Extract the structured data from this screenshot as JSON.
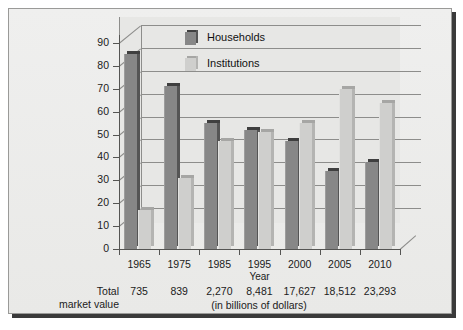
{
  "chart_data": {
    "type": "bar",
    "title": "",
    "xlabel": "Year",
    "ylabel": "",
    "ylim": [
      0,
      90
    ],
    "yticks": [
      0,
      10,
      20,
      30,
      40,
      50,
      60,
      70,
      80,
      90
    ],
    "grid": true,
    "legend_position": "top-center",
    "categories": [
      "1965",
      "1975",
      "1985",
      "1995",
      "2000",
      "2005",
      "2010"
    ],
    "series": [
      {
        "name": "Households",
        "color": "#878787",
        "values": [
          85,
          71,
          55,
          52,
          47,
          34,
          38
        ]
      },
      {
        "name": "Institutions",
        "color": "#cfcfcd",
        "values": [
          17,
          31,
          47,
          51,
          55,
          70,
          64
        ]
      }
    ],
    "annotations": {
      "total_row_label_line1": "Total",
      "total_row_label_line2": "market value",
      "total_values": [
        "735",
        "839",
        "2,270",
        "8,481",
        "17,627",
        "18,512",
        "23,293"
      ],
      "units_note": "(in billions of dollars)"
    }
  },
  "colors": {
    "panel_background": "#ececeb",
    "panel_border": "#9a9a98",
    "shadow": "#3a3a3a",
    "gridline": "#8d8d8b",
    "axis": "#555553",
    "households": "#878787",
    "institutions": "#cfcfcd",
    "text": "#1b1b1b"
  }
}
